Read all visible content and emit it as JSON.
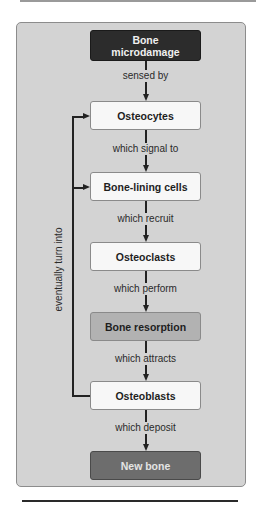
{
  "diagram": {
    "nodes": [
      {
        "id": "bone-microdamage",
        "label": "Bone\nmicrodamage",
        "line1": "Bone",
        "line2": "microdamage",
        "fill": "#2c2c2c"
      },
      {
        "id": "osteocytes",
        "label": "Osteocytes",
        "fill": "#f7f7f7"
      },
      {
        "id": "bone-lining-cells",
        "label": "Bone-lining cells",
        "fill": "#f7f7f7"
      },
      {
        "id": "osteoclasts",
        "label": "Osteoclasts",
        "fill": "#f7f7f7"
      },
      {
        "id": "bone-resorption",
        "label": "Bone resorption",
        "fill": "#b2b2b2"
      },
      {
        "id": "osteoblasts",
        "label": "Osteoblasts",
        "fill": "#f7f7f7"
      },
      {
        "id": "new-bone",
        "label": "New bone",
        "fill": "#6d6d6d"
      }
    ],
    "edges": [
      {
        "from": "bone-microdamage",
        "to": "osteocytes",
        "label": "sensed by"
      },
      {
        "from": "osteocytes",
        "to": "bone-lining-cells",
        "label": "which signal to"
      },
      {
        "from": "bone-lining-cells",
        "to": "osteoclasts",
        "label": "which recruit"
      },
      {
        "from": "osteoclasts",
        "to": "bone-resorption",
        "label": "which perform"
      },
      {
        "from": "bone-resorption",
        "to": "osteoblasts",
        "label": "which attracts"
      },
      {
        "from": "osteoblasts",
        "to": "new-bone",
        "label": "which deposit"
      }
    ],
    "feedback": {
      "from": "osteoblasts",
      "to": [
        "osteocytes",
        "bone-lining-cells"
      ],
      "label": "eventually turn into"
    },
    "colors": {
      "panel": "#d3d3d3",
      "dark_node": "#2c2c2c",
      "mid_node": "#b2b2b2",
      "deep_node": "#6d6d6d",
      "light_node": "#f7f7f7"
    }
  }
}
